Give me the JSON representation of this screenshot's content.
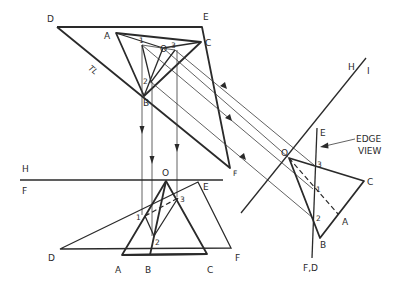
{
  "diagram": {
    "colors": {
      "line": "#2a2a2a",
      "background": "#ffffff"
    },
    "top_view": {
      "labels": {
        "D": "D",
        "E": "E",
        "F": "F",
        "A": "A",
        "B": "B",
        "C": "C",
        "O": "O",
        "p1": "1",
        "p2": "2",
        "p3": "3",
        "TL": "TL"
      }
    },
    "front_view": {
      "fold_line": {
        "upper": "H",
        "lower": "F"
      },
      "labels": {
        "D": "D",
        "E": "E",
        "F": "F",
        "A": "A",
        "B": "B",
        "C": "C",
        "O": "O",
        "p1": "1",
        "p2": "2",
        "p3": "3"
      }
    },
    "auxiliary_view": {
      "fold_line": {
        "label_h": "H",
        "label_i": "I"
      },
      "labels": {
        "E": "E",
        "FD": "F,D",
        "A": "A",
        "B": "B",
        "C": "C",
        "O": "O",
        "p1": "1",
        "p2": "2",
        "p3": "3"
      },
      "annotation": {
        "line1": "EDGE",
        "line2": "VIEW"
      }
    }
  }
}
